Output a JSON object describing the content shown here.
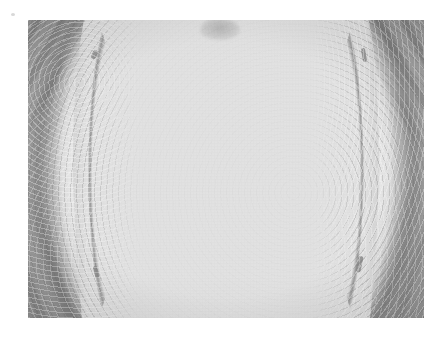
{
  "page": {
    "background_color": "#ffffff",
    "width": 440,
    "height": 346,
    "caption": ""
  },
  "photo": {
    "kind": "grayscale-photograph",
    "subject": "vertical specimen cross-section with paired bright crescent arcs",
    "left": 28,
    "top": 20,
    "width": 396,
    "height": 298,
    "border_color": "#ffffff",
    "regions": [
      {
        "name": "central-column",
        "description": "bright light-grey barrel-shaped column running top to bottom",
        "color": "#e7e7e7"
      },
      {
        "name": "left-crescent",
        "description": "bright grainy crescent band curving from top-left to bottom-left",
        "color": "#ededed"
      },
      {
        "name": "right-crescent",
        "description": "bright grainy crescent band curving from top-right to bottom-right",
        "color": "#ededed"
      },
      {
        "name": "outer-matrix",
        "description": "darker grey surrounding field with diagonal striations in the corners",
        "color": "#a5a5a5"
      },
      {
        "name": "top-smudge",
        "description": "faint darker grey smudge near the top centre",
        "color": "#a8a8a8"
      }
    ],
    "palette": {
      "highlight": "#f2f2f2",
      "core": "#e7e7e7",
      "midtone": "#c6c6c6",
      "matrix": "#a5a5a5",
      "shadow": "#8b8b8b",
      "deep_shadow": "#757575"
    }
  }
}
